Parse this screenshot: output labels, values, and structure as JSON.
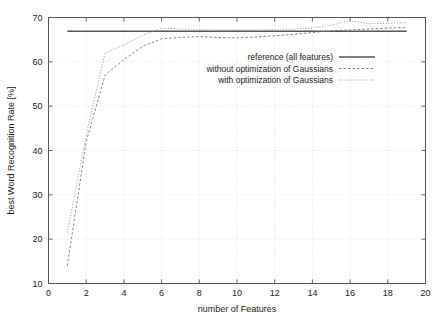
{
  "chart_data": {
    "type": "line",
    "title": "",
    "xlabel": "number of Features",
    "ylabel": "best Word Recognition Rate [%]",
    "xlim": [
      0,
      20
    ],
    "ylim": [
      10,
      70
    ],
    "xticks": [
      0,
      2,
      4,
      6,
      8,
      10,
      12,
      14,
      16,
      18,
      20
    ],
    "yticks": [
      10,
      20,
      30,
      40,
      50,
      60,
      70
    ],
    "grid": true,
    "legend_position": "center-right",
    "x": [
      1,
      2,
      3,
      4,
      5,
      6,
      7,
      8,
      9,
      10,
      11,
      12,
      13,
      14,
      15,
      16,
      17,
      18,
      19
    ],
    "series": [
      {
        "name": "reference (all features)",
        "style": "solid",
        "color": "#555555",
        "constant_value": 66.9,
        "values": [
          66.9,
          66.9,
          66.9,
          66.9,
          66.9,
          66.9,
          66.9,
          66.9,
          66.9,
          66.9,
          66.9,
          66.9,
          66.9,
          66.9,
          66.9,
          66.9,
          66.9,
          66.9,
          66.9
        ]
      },
      {
        "name": "without optimization of Gaussians",
        "style": "dashed",
        "color": "#777777",
        "values": [
          14.0,
          42.0,
          57.0,
          60.5,
          63.5,
          65.2,
          65.5,
          65.7,
          65.5,
          65.4,
          65.6,
          65.9,
          66.2,
          66.6,
          67.0,
          67.2,
          67.4,
          67.6,
          67.8
        ]
      },
      {
        "name": "with optimization of Gaussians",
        "style": "dotted",
        "color": "#888888",
        "values": [
          21.5,
          43.5,
          62.0,
          63.8,
          66.0,
          67.6,
          67.4,
          67.3,
          67.2,
          67.2,
          67.2,
          67.3,
          67.4,
          67.6,
          68.3,
          69.2,
          68.6,
          68.7,
          68.8
        ]
      }
    ],
    "legend": [
      "reference (all features)",
      "without optimization of Gaussians",
      "with optimization of Gaussians"
    ]
  }
}
